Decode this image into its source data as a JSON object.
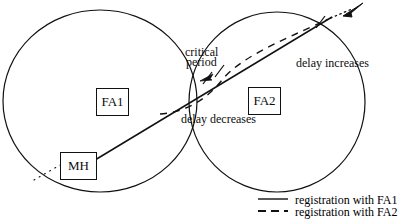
{
  "figure": {
    "type": "diagram",
    "title_visible": false,
    "background": "#ffffff",
    "stroke_color": "#111111"
  },
  "nodes": {
    "fa1_label": "FA1",
    "fa2_label": "FA2",
    "mh_label": "MH"
  },
  "annotations": {
    "critical_line1": "critical",
    "critical_line2": "period",
    "delay_increases": "delay increases",
    "delay_decreases": "delay decreases"
  },
  "legend": {
    "items": [
      {
        "label": "registration with FA1",
        "style": "solid"
      },
      {
        "label": "registration with FA2",
        "style": "dashed"
      }
    ]
  },
  "geometry": {
    "circle_fa1": {
      "cx": 100,
      "cy": 101,
      "r": 96
    },
    "circle_fa2": {
      "cx": 277,
      "cy": 102,
      "r": 88
    },
    "trajectory": {
      "from_x": 95,
      "from_y": 160,
      "to_x": 361,
      "to_y": 7
    },
    "tick_marks": [
      {
        "x": 207,
        "y": 78
      },
      {
        "x": 219,
        "y": 71
      },
      {
        "x": 320,
        "y": 22
      }
    ]
  }
}
